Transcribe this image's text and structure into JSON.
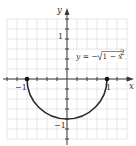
{
  "chart_data": {
    "type": "line",
    "title": "",
    "xlabel": "x",
    "ylabel": "y",
    "xlim": [
      -1.5,
      1.5
    ],
    "ylim": [
      -1.5,
      1.5
    ],
    "grid": true,
    "grid_step": 0.25,
    "x_tick_labels": [
      {
        "value": -1,
        "label": "−1"
      },
      {
        "value": 1,
        "label": "1"
      }
    ],
    "y_tick_labels": [
      {
        "value": 1,
        "label": "1"
      },
      {
        "value": -1,
        "label": "−1"
      }
    ],
    "series": [
      {
        "name": "y = −√(1 − x²)",
        "description": "lower semicircle of unit circle",
        "x": [
          -1,
          -0.75,
          -0.5,
          -0.25,
          0,
          0.25,
          0.5,
          0.75,
          1
        ],
        "y": [
          0,
          -0.661,
          -0.866,
          -0.968,
          -1,
          -0.968,
          -0.866,
          -0.661,
          0
        ]
      }
    ],
    "endpoints": [
      {
        "x": -1,
        "y": 0,
        "filled": true
      },
      {
        "x": 1,
        "y": 0,
        "filled": true
      }
    ],
    "annotations": [
      {
        "text": "y = −√(1 − x²)",
        "x": 0.2,
        "y": 0.55
      }
    ]
  },
  "labels": {
    "x_axis": "x",
    "y_axis": "y",
    "x_neg1": "−1",
    "x_pos1": "1",
    "y_pos1": "1",
    "y_neg1": "−1",
    "eq_y": "y",
    "eq_eq": " = −",
    "eq_one": "1 − ",
    "eq_x": "x",
    "eq_sup": "2"
  },
  "colors": {
    "curve": "#2a2a2a",
    "grid": "#dcdcdc",
    "axis": "#3a3a3a"
  }
}
